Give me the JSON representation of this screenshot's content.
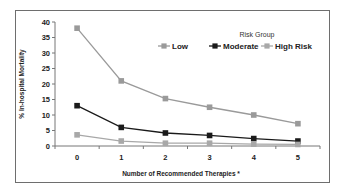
{
  "chart_data": {
    "type": "line",
    "title": "",
    "xlabel": "Number of Recommended Therapies *",
    "ylabel": "% In-hospital Mortality",
    "x": [
      0,
      1,
      2,
      3,
      4,
      5
    ],
    "categories": [
      "0",
      "1",
      "2",
      "3",
      "4",
      "5"
    ],
    "ylim": [
      0,
      40
    ],
    "yticks": [
      0,
      5,
      10,
      15,
      20,
      25,
      30,
      35,
      40
    ],
    "grid": false,
    "legend": {
      "title": "Risk Group",
      "position": "top-right",
      "entries": [
        "Low",
        "Moderate",
        "High Risk"
      ]
    },
    "series": [
      {
        "name": "Low",
        "color": "#9a9a9a",
        "values": [
          38,
          21,
          15.3,
          12.5,
          10,
          7.2
        ]
      },
      {
        "name": "Moderate",
        "color": "#1a1a1a",
        "values": [
          13,
          6,
          4.2,
          3.4,
          2.4,
          1.6
        ]
      },
      {
        "name": "High Risk",
        "color": "#a8a8a8",
        "values": [
          3.6,
          1.6,
          0.9,
          0.9,
          0.6,
          0.5
        ]
      }
    ]
  }
}
